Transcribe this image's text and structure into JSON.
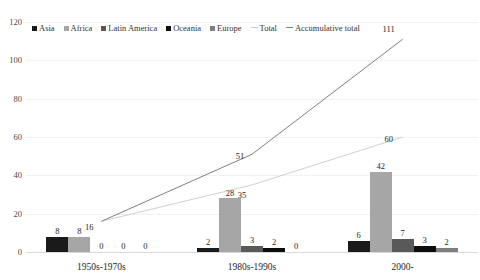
{
  "chart_data": {
    "type": "bar",
    "title": "",
    "xlabel": "",
    "ylabel": "",
    "ylim": [
      0,
      120
    ],
    "yticks": [
      0,
      20,
      40,
      60,
      80,
      100,
      120
    ],
    "grid": true,
    "legend_position": "top-left",
    "categories": [
      "1950s-1970s",
      "1980s-1990s",
      "2000-"
    ],
    "series": [
      {
        "name": "Asia",
        "type": "bar",
        "color": "#1a1a1a",
        "values": [
          8,
          2,
          6
        ]
      },
      {
        "name": "Africa",
        "type": "bar",
        "color": "#a6a6a6",
        "values": [
          8,
          28,
          42
        ]
      },
      {
        "name": "Latin America",
        "type": "bar",
        "color": "#595959",
        "values": [
          0,
          3,
          7
        ]
      },
      {
        "name": "Oceania",
        "type": "bar",
        "color": "#0d0d0d",
        "values": [
          0,
          2,
          3
        ]
      },
      {
        "name": "Europe",
        "type": "bar",
        "color": "#7f7f7f",
        "values": [
          0,
          0,
          2
        ]
      },
      {
        "name": "Total",
        "type": "line",
        "color": "#d0d0d0",
        "values": [
          16,
          35,
          60
        ]
      },
      {
        "name": "Accumulative total",
        "type": "line",
        "color": "#808080",
        "values": [
          16,
          51,
          111
        ]
      }
    ]
  },
  "legend": {
    "items": [
      {
        "label": "Asia",
        "marker": "square",
        "color": "#1a1a1a"
      },
      {
        "label": "Africa",
        "marker": "square",
        "color": "#a6a6a6"
      },
      {
        "label": "Latin America",
        "marker": "square",
        "color": "#595959"
      },
      {
        "label": "Oceania",
        "marker": "square",
        "color": "#0d0d0d"
      },
      {
        "label": "Europe",
        "marker": "square",
        "color": "#7f7f7f"
      },
      {
        "label": "Total",
        "marker": "line",
        "color": "#d0d0d0"
      },
      {
        "label": "Accumulative total",
        "marker": "line",
        "color": "#808080"
      }
    ]
  }
}
